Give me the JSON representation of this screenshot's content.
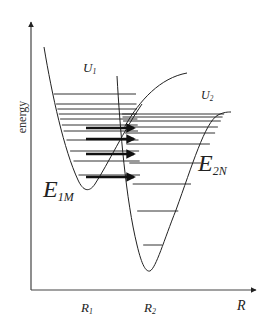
{
  "diagram": {
    "y_axis_label": "energy",
    "x_axis_label": "R",
    "x_ticks": [
      {
        "main": "R",
        "sub": "1"
      },
      {
        "main": "R",
        "sub": "2"
      }
    ],
    "curve_labels": {
      "u1": {
        "main": "U",
        "sub": "1"
      },
      "u2": {
        "main": "U",
        "sub": "2"
      }
    },
    "level_labels": {
      "e1m": {
        "main": "E",
        "sub": "1M"
      },
      "e2n": {
        "main": "E",
        "sub": "2N"
      }
    },
    "left_well_levels_y": [
      94,
      104,
      109,
      114,
      119,
      125,
      131,
      140,
      151,
      161,
      175
    ],
    "right_well_levels_y": [
      114,
      117,
      121,
      127,
      133,
      144,
      163,
      184,
      211,
      245
    ],
    "transfer_arrows_y": [
      128,
      139,
      154,
      177
    ],
    "line_color": "#222222",
    "arrow_color": "#111111"
  }
}
